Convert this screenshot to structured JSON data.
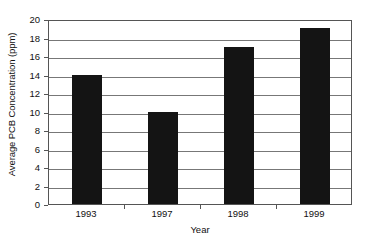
{
  "chart_data": {
    "type": "bar",
    "title": "",
    "subtitle": "",
    "xlabel": "Year",
    "ylabel": "Average PCB Concentration (ppm)",
    "categories": [
      "1993",
      "1997",
      "1998",
      "1999"
    ],
    "values": [
      14,
      10,
      17,
      19
    ],
    "series": [
      {
        "name": "Average PCB Concentration (ppm)",
        "values": [
          14,
          10,
          17,
          19
        ]
      }
    ],
    "ylim": [
      0,
      20
    ],
    "ytick_step": 2,
    "yticks": [
      0,
      2,
      4,
      6,
      8,
      10,
      12,
      14,
      16,
      18,
      20
    ],
    "ytick_labels": [
      "0",
      "2",
      "4",
      "6",
      "8",
      "10",
      "12",
      "14",
      "16",
      "18",
      "20"
    ],
    "grid": "horizontal",
    "legend": "none",
    "bar_color": "#141414",
    "gridline_color": "#777777",
    "axis_color": "#555555",
    "background_color": "#ffffff",
    "annotations": []
  }
}
